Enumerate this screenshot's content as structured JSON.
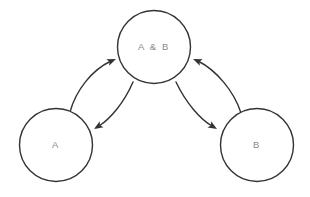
{
  "diagram": {
    "background_color": "#ffffff",
    "stroke_color": "#333333",
    "label_color": "#8a8a8a",
    "node_fill": "#ffffff",
    "stroke_width": 1.4,
    "nodes": [
      {
        "id": "ab",
        "label": "A & B",
        "cx": 154,
        "cy": 47,
        "r": 36.5,
        "font_size": 9.5,
        "letter_spacing": 1.6
      },
      {
        "id": "a",
        "label": "A",
        "cx": 56,
        "cy": 145,
        "r": 36.5,
        "font_size": 9.5,
        "letter_spacing": 1.6
      },
      {
        "id": "b",
        "label": "B",
        "cx": 257,
        "cy": 145,
        "r": 36.5,
        "font_size": 9.5,
        "letter_spacing": 1.6
      }
    ],
    "edges": [
      {
        "id": "a-to-ab",
        "from": "a",
        "to": "ab",
        "direction": "up-right",
        "path": "M 70 112 C 76 90 92 70 111 61",
        "arrow_x": 116,
        "arrow_y": 59,
        "arrow_angle": -23
      },
      {
        "id": "ab-to-a",
        "from": "ab",
        "to": "a",
        "direction": "down-left",
        "path": "M 133 82 C 124 103 110 119 99 126",
        "arrow_x": 94,
        "arrow_y": 129,
        "arrow_angle": 148
      },
      {
        "id": "b-to-ab",
        "from": "b",
        "to": "ab",
        "direction": "up-left",
        "path": "M 241 113 C 234 91 216 70 198 61",
        "arrow_x": 193,
        "arrow_y": 59,
        "arrow_angle": 203
      },
      {
        "id": "ab-to-b",
        "from": "ab",
        "to": "b",
        "direction": "down-right",
        "path": "M 176 82 C 186 103 200 119 212 126",
        "arrow_x": 217,
        "arrow_y": 129,
        "arrow_angle": 31
      }
    ]
  }
}
